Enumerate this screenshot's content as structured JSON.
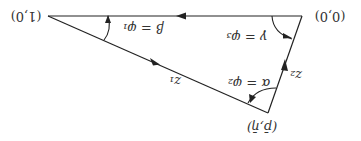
{
  "diagram": {
    "orientation": "rotated-180",
    "vertices": {
      "origin": {
        "label": "(0,0)"
      },
      "unit": {
        "label": "(1,0)"
      },
      "apex": {
        "label": "(p̄,η̄)"
      }
    },
    "edges": {
      "z1": {
        "label": "z₁"
      },
      "z2": {
        "label": "z₂"
      },
      "base": {
        "label": ""
      }
    },
    "angles": {
      "beta": {
        "label": "β = φ₁"
      },
      "gamma": {
        "label": "γ = φ₃"
      },
      "alpha": {
        "label": "α = φ₂"
      }
    },
    "colors": {
      "stroke": "#222222",
      "text": "#333333",
      "background": "#ffffff"
    }
  }
}
